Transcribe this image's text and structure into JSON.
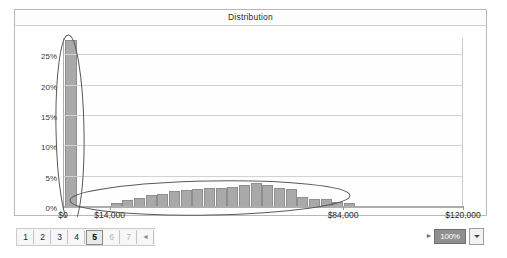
{
  "window": {
    "title": "Distribution"
  },
  "chart_data": {
    "type": "bar",
    "title": "Distribution",
    "xlabel": "",
    "ylabel": "",
    "grid": true,
    "legend": "none",
    "ylim": [
      0,
      28
    ],
    "ytick_labels": [
      "0%",
      "5%",
      "10%",
      "15%",
      "20%",
      "25%"
    ],
    "ytick_values": [
      0,
      5,
      10,
      15,
      20,
      25
    ],
    "xlim": [
      0,
      120000
    ],
    "xtick_labels": [
      "$0",
      "$14,000",
      "$84,000",
      "$120,000"
    ],
    "xtick_values": [
      0,
      14000,
      84000,
      120000
    ],
    "bar_color": "#a9a9a9",
    "categories": [
      0,
      14000,
      17500,
      21000,
      24500,
      28000,
      31500,
      35000,
      38500,
      42000,
      45500,
      49000,
      52500,
      56000,
      59500,
      63000,
      66500,
      70000,
      73500,
      77000,
      80500,
      84000
    ],
    "values": [
      27.5,
      0.6,
      1.2,
      1.5,
      2.0,
      2.1,
      2.6,
      2.8,
      2.9,
      3.1,
      3.1,
      3.3,
      3.6,
      3.9,
      3.6,
      3.2,
      3.0,
      1.6,
      1.4,
      1.3,
      0.9,
      0.7
    ],
    "annotations": [
      {
        "shape": "ellipse",
        "label": "zero-spike-circle",
        "cx": 14000,
        "cy": 14,
        "rx": 9000,
        "ry": 15
      },
      {
        "shape": "ellipse",
        "label": "distribution-body-circle",
        "cx": 50000,
        "cy": 2.5,
        "rx": 38000,
        "ry": 3.0
      }
    ]
  },
  "toolbar": {
    "pages": [
      {
        "label": "1",
        "state": "normal"
      },
      {
        "label": "2",
        "state": "normal"
      },
      {
        "label": "3",
        "state": "normal"
      },
      {
        "label": "4",
        "state": "normal"
      },
      {
        "label": "5",
        "state": "active"
      },
      {
        "label": "6",
        "state": "dim"
      },
      {
        "label": "7",
        "state": "dim"
      },
      {
        "label": "◄",
        "state": "arrow"
      }
    ],
    "zoom": {
      "prev_arrow": "►",
      "value": "100%",
      "dropdown_icon": "chevron-down-icon"
    }
  }
}
